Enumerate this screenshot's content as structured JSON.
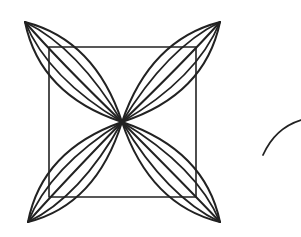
{
  "diagram": {
    "stroke_color": "#222222",
    "background": "#ffffff",
    "square": {
      "x": 49,
      "y": 47,
      "width": 147,
      "height": 150
    },
    "center": {
      "x": 122,
      "y": 122
    },
    "petals": [
      {
        "name": "top-left",
        "tip": {
          "x": 25,
          "y": 22
        }
      },
      {
        "name": "top-right",
        "tip": {
          "x": 220,
          "y": 22
        }
      },
      {
        "name": "bottom-left",
        "tip": {
          "x": 28,
          "y": 222
        }
      },
      {
        "name": "bottom-right",
        "tip": {
          "x": 220,
          "y": 222
        }
      }
    ],
    "arc": {
      "start": {
        "x": 263,
        "y": 155
      },
      "end": {
        "x": 301,
        "y": 120
      }
    }
  }
}
